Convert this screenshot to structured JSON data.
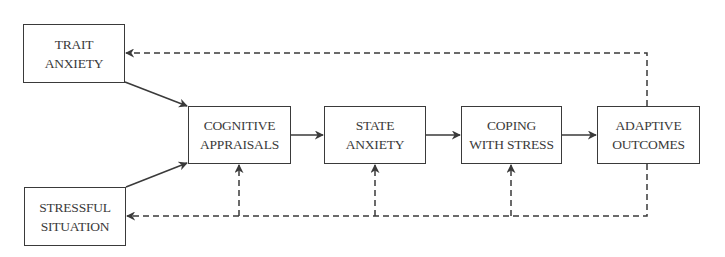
{
  "diagram": {
    "colors": {
      "stroke": "#3a3a3a",
      "background": "#ffffff",
      "text": "#3a3a3a"
    },
    "nodes": [
      {
        "id": "trait_anxiety",
        "line1": "TRAIT",
        "line2": "ANXIETY",
        "x": 23,
        "y": 24,
        "w": 102,
        "h": 59
      },
      {
        "id": "stressful_situation",
        "line1": "STRESSFUL",
        "line2": "SITUATION",
        "x": 24,
        "y": 187,
        "w": 102,
        "h": 59
      },
      {
        "id": "cognitive_appraisals",
        "line1": "COGNITIVE",
        "line2": "APPRAISALS",
        "x": 188,
        "y": 106,
        "w": 103,
        "h": 58
      },
      {
        "id": "state_anxiety",
        "line1": "STATE",
        "line2": "ANXIETY",
        "x": 324,
        "y": 106,
        "w": 102,
        "h": 58
      },
      {
        "id": "coping_with_stress",
        "line1": "COPING",
        "line2": "WITH STRESS",
        "x": 461,
        "y": 106,
        "w": 101,
        "h": 58
      },
      {
        "id": "adaptive_outcomes",
        "line1": "ADAPTIVE",
        "line2": "OUTCOMES",
        "x": 597,
        "y": 106,
        "w": 103,
        "h": 58
      }
    ],
    "edges": [
      {
        "from": "trait_anxiety",
        "to": "cognitive_appraisals",
        "style": "solid"
      },
      {
        "from": "stressful_situation",
        "to": "cognitive_appraisals",
        "style": "solid"
      },
      {
        "from": "cognitive_appraisals",
        "to": "state_anxiety",
        "style": "solid"
      },
      {
        "from": "state_anxiety",
        "to": "coping_with_stress",
        "style": "solid"
      },
      {
        "from": "coping_with_stress",
        "to": "adaptive_outcomes",
        "style": "solid"
      },
      {
        "from": "adaptive_outcomes",
        "to": "trait_anxiety",
        "style": "dashed"
      },
      {
        "from": "adaptive_outcomes",
        "to": "stressful_situation",
        "style": "dashed"
      },
      {
        "from": "adaptive_outcomes",
        "to": "cognitive_appraisals",
        "style": "dashed"
      },
      {
        "from": "adaptive_outcomes",
        "to": "state_anxiety",
        "style": "dashed"
      },
      {
        "from": "adaptive_outcomes",
        "to": "coping_with_stress",
        "style": "dashed"
      }
    ]
  }
}
